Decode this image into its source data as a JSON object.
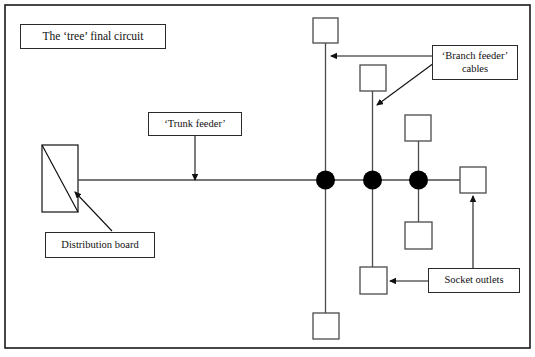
{
  "diagram": {
    "title": "The ‘tree’ final circuit",
    "frame": {
      "x": 5,
      "y": 5,
      "width": 525,
      "height": 343,
      "stroke": "#1a1a1a",
      "stroke_width": 1.5
    },
    "colors": {
      "line": "#4a4a4a",
      "node": "#000000",
      "box_border": "#2b2b2b",
      "text": "#111111",
      "background": "#ffffff"
    },
    "labels": {
      "title": "The ‘tree’ final circuit",
      "trunk_feeder": "‘Trunk feeder’",
      "branch_feeder_line1": "‘Branch feeder’",
      "branch_feeder_line2": "cables",
      "distribution_board": "Distribution board",
      "socket_outlets": "Socket outlets"
    },
    "distribution_board": {
      "x": 42,
      "y": 145,
      "width": 36,
      "height": 67,
      "diagonal": true
    },
    "trunk": {
      "y": 180,
      "x_start": 78,
      "x_end": 460
    },
    "junction_nodes": [
      {
        "name": "node-1",
        "cx": 325,
        "cy": 180,
        "r": 9
      },
      {
        "name": "node-2",
        "cx": 372,
        "cy": 180,
        "r": 9
      },
      {
        "name": "node-3",
        "cx": 418,
        "cy": 180,
        "r": 9
      }
    ],
    "socket_squares": [
      {
        "name": "socket-top-branch-1",
        "x": 313,
        "y": 18,
        "size": 25
      },
      {
        "name": "socket-bottom-branch-1",
        "x": 313,
        "y": 313,
        "size": 26
      },
      {
        "name": "socket-top-branch-2",
        "x": 360,
        "y": 65,
        "size": 26
      },
      {
        "name": "socket-bottom-branch-2",
        "x": 360,
        "y": 267,
        "size": 27
      },
      {
        "name": "socket-top-branch-3",
        "x": 405,
        "y": 115,
        "size": 26
      },
      {
        "name": "socket-bottom-branch-3",
        "x": 405,
        "y": 222,
        "size": 27
      },
      {
        "name": "socket-right-end",
        "x": 460,
        "y": 167,
        "size": 26
      }
    ],
    "branch_lines": [
      {
        "name": "branch-1",
        "x": 325,
        "y_top": 43,
        "y_bottom": 313
      },
      {
        "name": "branch-2",
        "x": 372,
        "y_top": 91,
        "y_bottom": 267
      },
      {
        "name": "branch-3",
        "x": 418,
        "y_top": 141,
        "y_bottom": 222
      }
    ],
    "annotation_arrows": [
      {
        "name": "trunk-feeder-arrow",
        "from": [
          195,
          136
        ],
        "to": [
          195,
          180
        ],
        "direction": "down"
      },
      {
        "name": "branch-feeder-arrow-horizontal",
        "from": [
          432,
          56
        ],
        "to": [
          329,
          56
        ],
        "direction": "left"
      },
      {
        "name": "branch-feeder-arrow-diagonal",
        "from": [
          434,
          62
        ],
        "to": [
          376,
          106
        ],
        "direction": "down-left"
      },
      {
        "name": "distribution-board-arrow",
        "from": [
          110,
          231
        ],
        "to": [
          74,
          192
        ],
        "direction": "up-left"
      },
      {
        "name": "socket-outlets-arrow-left",
        "from": [
          428,
          281
        ],
        "to": [
          389,
          281
        ],
        "direction": "left"
      },
      {
        "name": "socket-outlets-arrow-up",
        "from": [
          473,
          268
        ],
        "to": [
          473,
          195
        ],
        "direction": "up"
      }
    ]
  }
}
